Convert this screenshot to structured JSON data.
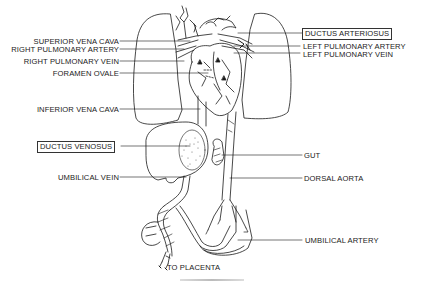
{
  "diagram": {
    "labels_left": [
      {
        "id": "superior-vena-cava",
        "text": "SUPERIOR VENA CAVA",
        "boxed": false
      },
      {
        "id": "right-pulmonary-artery",
        "text": "RIGHT PULMONARY ARTERY",
        "boxed": false
      },
      {
        "id": "right-pulmonary-vein",
        "text": "RIGHT PULMONARY VEIN",
        "boxed": false
      },
      {
        "id": "foramen-ovale",
        "text": "FORAMEN OVALE",
        "boxed": false
      },
      {
        "id": "inferior-vena-cava",
        "text": "INFERIOR VENA CAVA",
        "boxed": false
      },
      {
        "id": "ductus-venosus",
        "text": "DUCTUS VENOSUS",
        "boxed": true
      },
      {
        "id": "umbilical-vein",
        "text": "UMBILICAL VEIN",
        "boxed": false
      }
    ],
    "labels_right": [
      {
        "id": "ductus-arteriosus",
        "text": "DUCTUS ARTERIOSUS",
        "boxed": true
      },
      {
        "id": "left-pulmonary-artery",
        "text": "LEFT PULMONARY ARTERY",
        "boxed": false
      },
      {
        "id": "left-pulmonary-vein",
        "text": "LEFT PULMONARY VEIN",
        "boxed": false
      },
      {
        "id": "gut",
        "text": "GUT",
        "boxed": false
      },
      {
        "id": "dorsal-aorta",
        "text": "DORSAL AORTA",
        "boxed": false
      },
      {
        "id": "umbilical-artery",
        "text": "UMBILICAL ARTERY",
        "boxed": false
      }
    ],
    "bottom_label": {
      "id": "to-placenta",
      "text": "TO PLACENTA"
    },
    "colors": {
      "ink": "#1a1a1a",
      "background": "#ffffff",
      "stipple": "#555555"
    }
  }
}
